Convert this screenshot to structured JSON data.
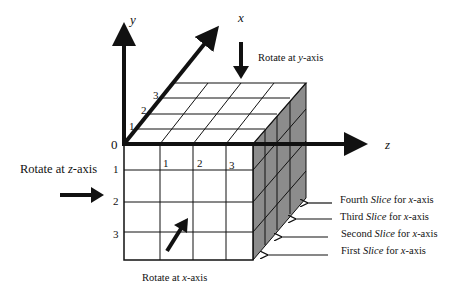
{
  "axes": {
    "y_label": "y",
    "x_label": "x",
    "z_label": "z",
    "origin_label": "0"
  },
  "x_axis_ticks": [
    "1",
    "2",
    "3"
  ],
  "y_axis_ticks": [
    "1",
    "2",
    "3"
  ],
  "z_axis_ticks": [
    "1",
    "2",
    "3"
  ],
  "rotations": {
    "y": {
      "prefix": "Rotate at ",
      "axis": "y",
      "suffix": "-axis"
    },
    "z": {
      "prefix": "Rotate at ",
      "axis": "z",
      "suffix": "-axis"
    },
    "x": {
      "prefix": "Rotate at ",
      "axis": "x",
      "suffix": "-axis"
    }
  },
  "slices": [
    {
      "ordinal": "Fourth",
      "word": "Slice",
      "mid": " for ",
      "axis": "x",
      "suffix": "-axis"
    },
    {
      "ordinal": "Third",
      "word": "Slice",
      "mid": " for ",
      "axis": "x",
      "suffix": "-axis"
    },
    {
      "ordinal": "Second",
      "word": "Slice",
      "mid": " for ",
      "axis": "x",
      "suffix": "-axis"
    },
    {
      "ordinal": "First",
      "word": "Slice",
      "mid": " for ",
      "axis": "x",
      "suffix": "-axis"
    }
  ],
  "colors": {
    "line": "#111111",
    "side_face": "#8c8c8c",
    "background": "#ffffff"
  }
}
